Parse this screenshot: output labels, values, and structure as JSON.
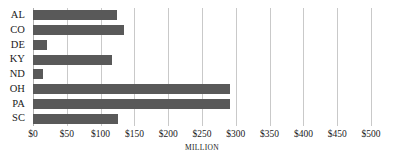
{
  "chart_data": {
    "type": "bar",
    "orientation": "horizontal",
    "title": "",
    "subtitle": "",
    "xlabel": "MILLION",
    "ylabel": "",
    "categories": [
      "AL",
      "CO",
      "DE",
      "KY",
      "ND",
      "OH",
      "PA",
      "SC"
    ],
    "values": [
      124,
      135,
      21,
      117,
      15,
      292,
      292,
      125
    ],
    "series": [
      {
        "name": "",
        "values": [
          124,
          135,
          21,
          117,
          15,
          292,
          292,
          125
        ]
      }
    ],
    "xlim": [
      0,
      500
    ],
    "ylim": null,
    "tick_values": [
      0,
      50,
      100,
      150,
      200,
      250,
      300,
      350,
      400,
      450,
      500
    ],
    "tick_labels": [
      "$0",
      "$50",
      "$100",
      "$150",
      "$200",
      "$250",
      "$300",
      "$350",
      "$400",
      "$450",
      "$500"
    ],
    "grid": true,
    "grid_axis": "x",
    "legend": false,
    "legend_position": "none",
    "bar_color": "#595959",
    "grid_color": "#c9c9c9",
    "background_color": "#ffffff",
    "text_color": "#1a1a1a",
    "annotations": []
  }
}
